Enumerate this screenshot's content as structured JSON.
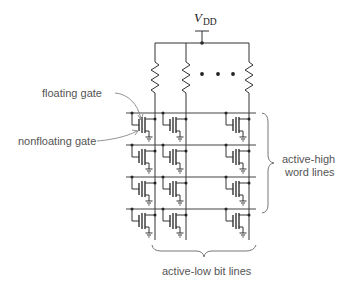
{
  "supply": {
    "symbol": "V",
    "subscript": "DD"
  },
  "labels": {
    "floating_gate": "floating gate",
    "nonfloating_gate": "nonfloating gate",
    "word_lines_line1": "active-high",
    "word_lines_line2": "word lines",
    "bit_lines": "active-low bit lines"
  },
  "array": {
    "word_line_count": 4,
    "bit_columns_drawn": 3,
    "ellipsis": "• • •"
  },
  "colors": {
    "wire": "#333333",
    "label": "#555555",
    "brace": "#777777"
  }
}
